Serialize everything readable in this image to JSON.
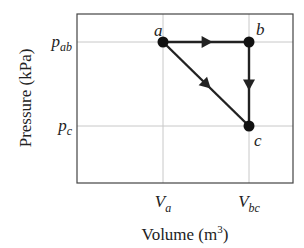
{
  "chart_data": {
    "type": "line",
    "title": "",
    "xlabel": "Volume (m³)",
    "ylabel": "Pressure (kPa)",
    "x_ticks": [
      {
        "key": "Va",
        "main": "V",
        "sub": "a"
      },
      {
        "key": "Vbc",
        "main": "V",
        "sub": "bc"
      }
    ],
    "y_ticks": [
      {
        "key": "pab",
        "main": "p",
        "sub": "ab"
      },
      {
        "key": "pc",
        "main": "p",
        "sub": "c"
      }
    ],
    "xlabel_parts": {
      "text": "Volume (m",
      "sup": "3",
      "close": ")"
    },
    "grid": true,
    "points": [
      {
        "label": "a",
        "x": "Va",
        "y": "pab"
      },
      {
        "label": "b",
        "x": "Vbc",
        "y": "pab"
      },
      {
        "label": "c",
        "x": "Vbc",
        "y": "pc"
      }
    ],
    "paths": [
      {
        "name": "a-to-b",
        "from": "a",
        "to": "b",
        "arrow": true
      },
      {
        "name": "b-to-c",
        "from": "b",
        "to": "c",
        "arrow": true
      },
      {
        "name": "a-to-c",
        "from": "a",
        "to": "c",
        "arrow": true
      }
    ],
    "colors": {
      "line": "#222222",
      "grid": "#c8c8c8",
      "frame": "#444444"
    }
  }
}
